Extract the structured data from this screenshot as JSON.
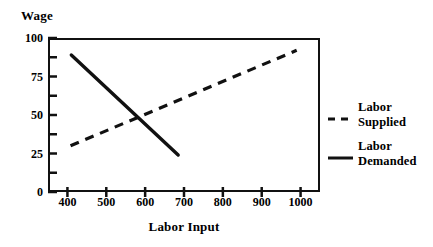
{
  "chart_data": {
    "type": "line",
    "title": "",
    "xlabel": "Labor Input",
    "ylabel": "Wage",
    "xlim": [
      350,
      1050
    ],
    "ylim": [
      0,
      100
    ],
    "grid": false,
    "legend_position": "right",
    "xticks": [
      "400",
      "500",
      "600",
      "700",
      "800",
      "900",
      "1000"
    ],
    "xtick_values": [
      400,
      500,
      600,
      700,
      800,
      900,
      1000
    ],
    "yticks": [
      "0",
      "25",
      "50",
      "75",
      "100"
    ],
    "ytick_values": [
      0,
      25,
      50,
      75,
      100
    ],
    "y_minor_tick_values": [
      12.5,
      37.5,
      62.5,
      87.5
    ],
    "series": [
      {
        "name": "Labor Supplied",
        "style": "dashed",
        "color": "#111111",
        "points": [
          [
            408,
            30
          ],
          [
            990,
            92
          ]
        ]
      },
      {
        "name": "Labor Demanded",
        "style": "solid",
        "color": "#111111",
        "points": [
          [
            410,
            89
          ],
          [
            685,
            24
          ]
        ]
      }
    ],
    "equilibrium": {
      "x": 578,
      "y": 50
    },
    "annotations": []
  },
  "legend": {
    "items": [
      {
        "name": "Labor Supplied",
        "line1": "Labor",
        "line2": "Supplied",
        "style": "dashed"
      },
      {
        "name": "Labor Demanded",
        "line1": "Labor",
        "line2": "Demanded",
        "style": "solid"
      }
    ]
  }
}
